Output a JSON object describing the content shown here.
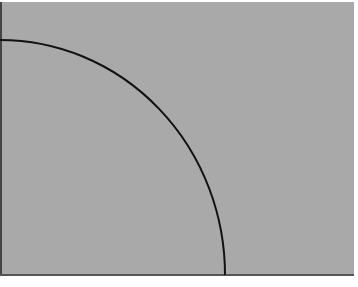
{
  "figure": {
    "background_color": "#a9a9a9",
    "line_color": "#111111",
    "shape": "quarter-arc",
    "arc": {
      "start": [
        0,
        40
      ],
      "end": [
        225,
        275
      ]
    }
  }
}
